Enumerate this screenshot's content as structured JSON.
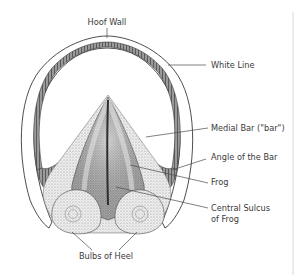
{
  "diagram": {
    "labels": {
      "hoof_wall": "Hoof Wall",
      "white_line": "White Line",
      "medial_bar": "Medial Bar (\"bar\")",
      "angle_of_bar": "Angle of the Bar",
      "frog": "Frog",
      "central_sulcus_1": "Central Sulcus",
      "central_sulcus_2": "of Frog",
      "bulbs_of_heel": "Bulbs of Heel"
    },
    "colors": {
      "ink": "#3a3a3a",
      "shade_dark": "#5a5a5a",
      "shade_mid": "#9a9a9a",
      "shade_light": "#d6d6d6",
      "background": "#ffffff",
      "border": "#d9d9d9"
    }
  }
}
